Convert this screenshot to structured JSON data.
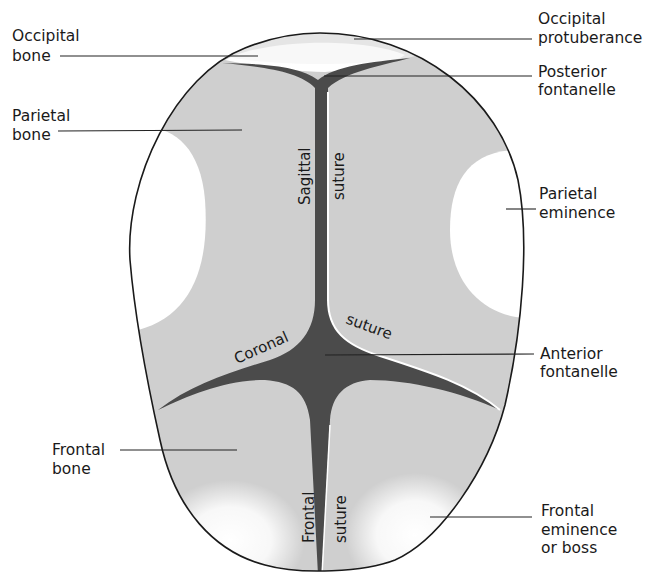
{
  "diagram": {
    "colors": {
      "bone": "#cfcfcf",
      "suture": "#4b4b4b",
      "eminence_highlight": "#ffffff",
      "outline": "#1a1a1a",
      "background": "#ffffff"
    },
    "labels": {
      "occipital_bone": [
        "Occipital",
        "bone"
      ],
      "parietal_bone": [
        "Parietal",
        "bone"
      ],
      "frontal_bone": [
        "Frontal",
        "bone"
      ],
      "occipital_protuberance": [
        "Occipital",
        "protuberance"
      ],
      "posterior_fontanelle": [
        "Posterior",
        "fontanelle"
      ],
      "parietal_eminence": [
        "Parietal",
        "eminence"
      ],
      "anterior_fontanelle": [
        "Anterior",
        "fontanelle"
      ],
      "frontal_eminence": [
        "Frontal",
        "eminence",
        "or boss"
      ]
    },
    "inline_labels": {
      "sagittal_word": "Sagittal",
      "sagittal_suture_word": "suture",
      "coronal_word": "Coronal",
      "coronal_suture_word": "suture",
      "frontal_word": "Frontal",
      "frontal_suture_word": "suture"
    }
  }
}
